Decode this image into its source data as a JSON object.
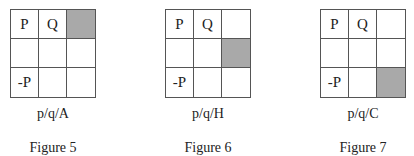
{
  "figures": [
    {
      "cells": [
        [
          "P",
          "Q",
          ""
        ],
        [
          "",
          "",
          ""
        ],
        [
          "-P",
          "",
          ""
        ]
      ],
      "shaded": [
        0,
        2
      ],
      "label": "p/q/A",
      "caption": "Figure 5"
    },
    {
      "cells": [
        [
          "P",
          "Q",
          ""
        ],
        [
          "",
          "",
          ""
        ],
        [
          "-P",
          "",
          ""
        ]
      ],
      "shaded": [
        1,
        2
      ],
      "label": "p/q/H",
      "caption": "Figure 6"
    },
    {
      "cells": [
        [
          "P",
          "Q",
          ""
        ],
        [
          "",
          "",
          ""
        ],
        [
          "-P",
          "",
          ""
        ]
      ],
      "shaded": [
        2,
        2
      ],
      "label": "p/q/C",
      "caption": "Figure 7"
    }
  ],
  "colors": {
    "shade": "#a9a9a9",
    "line": "#555555"
  }
}
